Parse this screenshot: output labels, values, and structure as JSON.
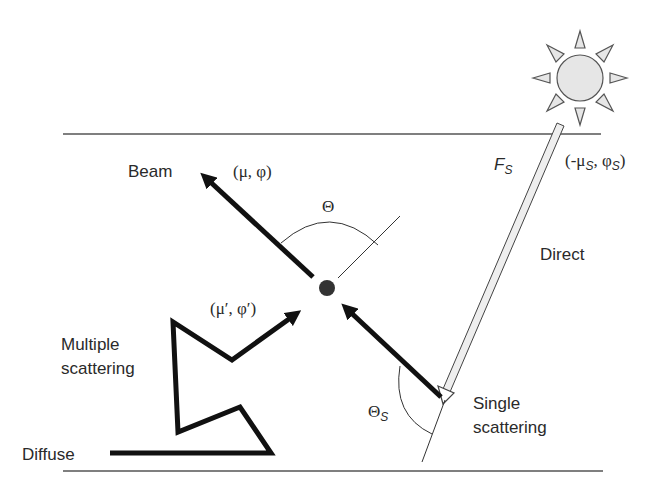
{
  "diagram": {
    "type": "radiative-transfer-scattering",
    "colors": {
      "stroke": "#111111",
      "boundary": "#555555",
      "thin_line": "#333333",
      "sun_fill": "#e6e6e6",
      "direct_beam_fill": "#eeeeee",
      "particle": "#333333",
      "text": "#2a2a2a"
    },
    "labels": {
      "beam": "Beam",
      "beam_direction": "(μ, φ)",
      "theta": "Θ",
      "incoming_direction": "(μ′, φ′)",
      "multiple_scattering_line1": "Multiple",
      "multiple_scattering_line2": "scattering",
      "diffuse": "Diffuse",
      "solar_flux_symbol": "F",
      "solar_flux_subscript": "S",
      "solar_direction_prefix": "(-μ",
      "solar_direction_sub1": "S",
      "solar_direction_mid": ", φ",
      "solar_direction_sub2": "S",
      "solar_direction_suffix": ")",
      "direct": "Direct",
      "theta_s_symbol": "Θ",
      "theta_s_subscript": "S",
      "single_scattering_line1": "Single",
      "single_scattering_line2": "scattering"
    },
    "icons": {
      "sun": "sun-icon",
      "particle": "scattering-particle-icon"
    }
  }
}
